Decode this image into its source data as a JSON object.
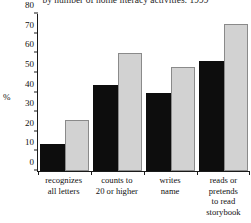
{
  "chart_data": {
    "type": "bar",
    "title": "by number of home literacy activities: 1999",
    "xlabel": "",
    "ylabel": "%",
    "ylim": [
      0,
      80
    ],
    "yticks": [
      0,
      10,
      20,
      30,
      40,
      50,
      60,
      70,
      80
    ],
    "grid": false,
    "legend": "none",
    "categories": [
      "recognizes all letters",
      "counts to 20 or higher",
      "writes name",
      "reads or pretends to read storybook"
    ],
    "category_lines": [
      [
        "recognizes",
        "all letters"
      ],
      [
        "counts to",
        "20 or higher"
      ],
      [
        "writes",
        "name"
      ],
      [
        "reads or",
        "pretends",
        "to read",
        "storybook"
      ]
    ],
    "series": [
      {
        "name": "dark",
        "color": "#0d0d0d",
        "values": [
          14,
          44,
          40,
          56
        ]
      },
      {
        "name": "light",
        "color": "#d2d2d2",
        "values": [
          26,
          60,
          53,
          75
        ]
      }
    ]
  }
}
